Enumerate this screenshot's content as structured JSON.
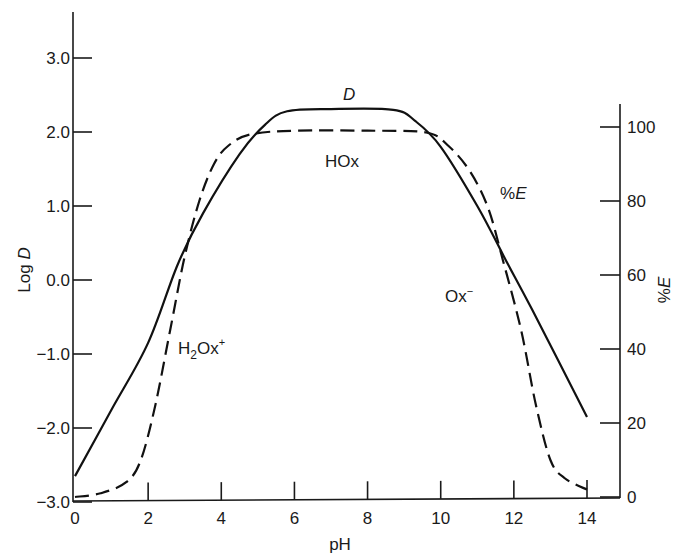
{
  "chart_data": {
    "type": "line",
    "title": "",
    "xlabel": "pH",
    "ylabel_left": "Log D",
    "ylabel_right": "%E",
    "xlim": [
      0,
      14
    ],
    "ylim_left": [
      -3.0,
      3.0
    ],
    "ylim_right": [
      0,
      100
    ],
    "x_ticks": [
      "0",
      "2",
      "4",
      "6",
      "8",
      "10",
      "12",
      "14"
    ],
    "y_left_ticks": [
      "3.0",
      "2.0",
      "1.0",
      "0.0",
      "−1.0",
      "−2.0",
      "−3.0"
    ],
    "y_right_ticks": [
      "100",
      "80",
      "60",
      "40",
      "20",
      "0"
    ],
    "grid": false,
    "series": [
      {
        "name": "D",
        "axis": "left",
        "style": "solid",
        "x": [
          0,
          1,
          2,
          2.8,
          3.5,
          4.5,
          5.2,
          5.8,
          7,
          8.7,
          9.3,
          10,
          11,
          11.8,
          12.5,
          14
        ],
        "values": [
          -2.65,
          -1.75,
          -0.85,
          0.2,
          0.9,
          1.7,
          2.1,
          2.28,
          2.31,
          2.3,
          2.15,
          1.8,
          1.0,
          0.25,
          -0.4,
          -1.85
        ]
      },
      {
        "name": "%E",
        "axis": "right",
        "style": "dashed",
        "x": [
          0,
          0.7,
          1.4,
          1.8,
          2.2,
          2.6,
          3.0,
          3.4,
          3.8,
          4.2,
          4.8,
          6,
          8,
          9.6,
          10.2,
          10.8,
          11.3,
          11.7,
          12.2,
          12.6,
          13.0,
          13.4,
          14
        ],
        "values": [
          0,
          1,
          4,
          10,
          25,
          45,
          65,
          80,
          90,
          95,
          98,
          99,
          99,
          98.5,
          95,
          88,
          78,
          64,
          45,
          25,
          10,
          5,
          2
        ]
      }
    ],
    "annotations": [
      {
        "text": "D",
        "italic": true,
        "x": 7.6,
        "y_logD": 2.55
      },
      {
        "text": "HOx",
        "x": 7.3,
        "y_logD": 1.5
      },
      {
        "text": "%E",
        "italic": true,
        "x": 12.1,
        "y_logD": 1.0
      },
      {
        "text": "Ox⁻",
        "x": 10.8,
        "y_logD": -0.25
      },
      {
        "text": "H₂Ox⁺",
        "x": 3.7,
        "y_logD": -1.0
      }
    ]
  },
  "labels": {
    "xlabel": "pH",
    "ylabel_left_prefix": "Log ",
    "ylabel_left_var": "D",
    "ylabel_right_pct": "%",
    "ylabel_right_var": "E",
    "ann_D": "D",
    "ann_HOx": "HOx",
    "ann_pctE_pct": "%",
    "ann_pctE_var": "E",
    "ann_Ox_base": "Ox",
    "ann_Ox_sup": "−",
    "ann_H2Ox_H": "H",
    "ann_H2Ox_sub": "2",
    "ann_H2Ox_rest": "Ox",
    "ann_H2Ox_sup": "+"
  }
}
